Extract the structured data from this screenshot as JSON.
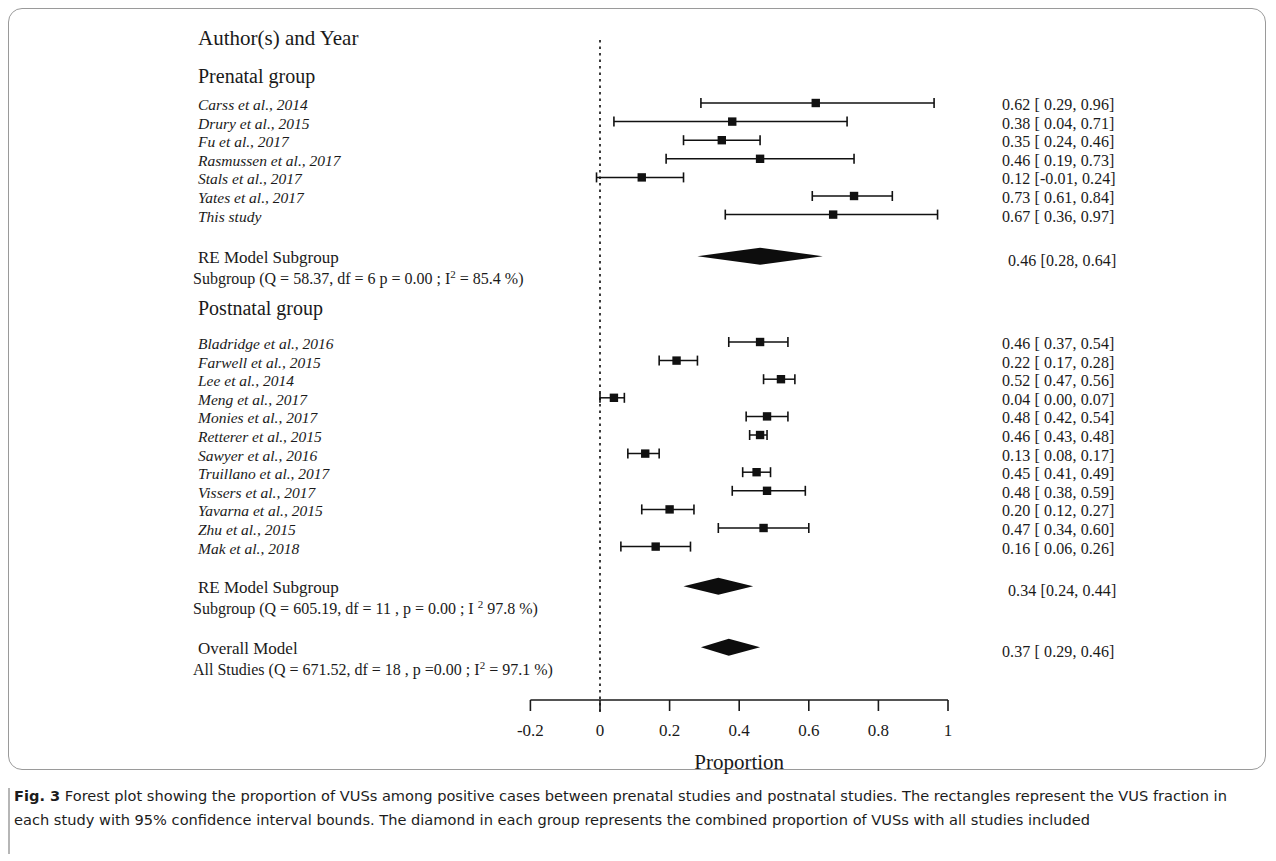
{
  "header": {
    "column_title": "Author(s) and Year"
  },
  "axis": {
    "title": "Proportion",
    "ticks": [
      "-0.2",
      "0",
      "0.2",
      "0.4",
      "0.6",
      "0.8",
      "1"
    ],
    "tick_values": [
      -0.2,
      0,
      0.2,
      0.4,
      0.6,
      0.8,
      1.0
    ],
    "min": -0.2,
    "max": 1.0,
    "reference_line": 0
  },
  "groups": [
    {
      "name": "Prenatal group",
      "summary_title": "RE Model Subgroup",
      "summary_stats_parts": {
        "pre": "Subgroup (Q = 58.37, df = 6 p = 0.00 ; I",
        "sup": "2",
        "post": " =  85.4 %)"
      },
      "summary_stats": "Subgroup (Q = 58.37, df = 6 p = 0.00 ; I2 =  85.4 %)",
      "summary_value_text": "0.46 [0.28, 0.64]",
      "summary_estimate": 0.46,
      "summary_ci": [
        0.28,
        0.64
      ],
      "studies": [
        {
          "label": "Carss et al., 2014",
          "value_text": "0.62 [ 0.29, 0.96]",
          "estimate": 0.62,
          "ci": [
            0.29,
            0.96
          ]
        },
        {
          "label": "Drury et al., 2015",
          "value_text": "0.38 [ 0.04, 0.71]",
          "estimate": 0.38,
          "ci": [
            0.04,
            0.71
          ]
        },
        {
          "label": "Fu et al., 2017",
          "value_text": "0.35 [ 0.24, 0.46]",
          "estimate": 0.35,
          "ci": [
            0.24,
            0.46
          ]
        },
        {
          "label": "Rasmussen et al., 2017",
          "value_text": "0.46 [ 0.19, 0.73]",
          "estimate": 0.46,
          "ci": [
            0.19,
            0.73
          ]
        },
        {
          "label": "Stals et al., 2017",
          "value_text": "0.12 [-0.01, 0.24]",
          "estimate": 0.12,
          "ci": [
            -0.01,
            0.24
          ]
        },
        {
          "label": "Yates et al., 2017",
          "value_text": "0.73 [ 0.61, 0.84]",
          "estimate": 0.73,
          "ci": [
            0.61,
            0.84
          ]
        },
        {
          "label": "This study",
          "value_text": "0.67 [ 0.36, 0.97]",
          "estimate": 0.67,
          "ci": [
            0.36,
            0.97
          ]
        }
      ]
    },
    {
      "name": "Postnatal group",
      "summary_title": "RE Model Subgroup",
      "summary_stats_parts": {
        "pre": "Subgroup (Q = 605.19, df = 11 , p = 0.00 ; I ",
        "sup": "2",
        "post": " 97.8 %)"
      },
      "summary_stats": "Subgroup (Q = 605.19, df = 11 , p = 0.00 ; I 2 97.8 %)",
      "summary_value_text": "0.34 [0.24, 0.44]",
      "summary_estimate": 0.34,
      "summary_ci": [
        0.24,
        0.44
      ],
      "studies": [
        {
          "label": "Bladridge et al., 2016",
          "value_text": "0.46 [ 0.37, 0.54]",
          "estimate": 0.46,
          "ci": [
            0.37,
            0.54
          ]
        },
        {
          "label": "Farwell et al., 2015",
          "value_text": "0.22 [ 0.17, 0.28]",
          "estimate": 0.22,
          "ci": [
            0.17,
            0.28
          ]
        },
        {
          "label": "Lee et al., 2014",
          "value_text": "0.52 [ 0.47, 0.56]",
          "estimate": 0.52,
          "ci": [
            0.47,
            0.56
          ]
        },
        {
          "label": "Meng et al., 2017",
          "value_text": "0.04 [ 0.00, 0.07]",
          "estimate": 0.04,
          "ci": [
            0.0,
            0.07
          ]
        },
        {
          "label": "Monies et al., 2017",
          "value_text": "0.48 [ 0.42, 0.54]",
          "estimate": 0.48,
          "ci": [
            0.42,
            0.54
          ]
        },
        {
          "label": "Retterer et al., 2015",
          "value_text": "0.46 [ 0.43, 0.48]",
          "estimate": 0.46,
          "ci": [
            0.43,
            0.48
          ]
        },
        {
          "label": "Sawyer et al., 2016",
          "value_text": "0.13 [ 0.08, 0.17]",
          "estimate": 0.13,
          "ci": [
            0.08,
            0.17
          ]
        },
        {
          "label": "Truillano et al., 2017",
          "value_text": "0.45 [ 0.41, 0.49]",
          "estimate": 0.45,
          "ci": [
            0.41,
            0.49
          ]
        },
        {
          "label": "Vissers et al., 2017",
          "value_text": "0.48 [ 0.38, 0.59]",
          "estimate": 0.48,
          "ci": [
            0.38,
            0.59
          ]
        },
        {
          "label": "Yavarna et al., 2015",
          "value_text": "0.20 [ 0.12, 0.27]",
          "estimate": 0.2,
          "ci": [
            0.12,
            0.27
          ]
        },
        {
          "label": "Zhu et al., 2015",
          "value_text": "0.47 [ 0.34, 0.60]",
          "estimate": 0.47,
          "ci": [
            0.34,
            0.6
          ]
        },
        {
          "label": "Mak et al., 2018",
          "value_text": "0.16 [ 0.06, 0.26]",
          "estimate": 0.16,
          "ci": [
            0.06,
            0.26
          ]
        }
      ]
    }
  ],
  "overall": {
    "summary_title": "Overall Model",
    "summary_stats_parts": {
      "pre": "All Studies (Q = 671.52, df = 18 , p =0.00 ; I",
      "sup": "2",
      "post": " =  97.1 %)"
    },
    "summary_stats": "All Studies (Q = 671.52, df = 18 , p =0.00 ; I2 =  97.1 %)",
    "summary_value_text": "0.37 [ 0.29, 0.46]",
    "summary_estimate": 0.37,
    "summary_ci": [
      0.29,
      0.46
    ]
  },
  "caption": {
    "figure_label": "Fig. 3",
    "text": " Forest plot showing the proportion of VUSs among positive cases between prenatal studies and postnatal studies. The rectangles represent the VUS fraction in each study with 95% confidence interval bounds. The diamond in each group represents the combined proportion of VUSs with all studies included"
  },
  "chart_data": {
    "type": "forest",
    "xlabel": "Proportion",
    "ylabel": "",
    "xlim": [
      -0.2,
      1.0
    ],
    "xticks": [
      -0.2,
      0,
      0.2,
      0.4,
      0.6,
      0.8,
      1.0
    ],
    "reference_line": 0,
    "grid": false,
    "legend": "none",
    "marker": "square",
    "summary_marker": "diamond",
    "categories": [
      "Carss et al., 2014",
      "Drury et al., 2015",
      "Fu et al., 2017",
      "Rasmussen et al., 2017",
      "Stals et al., 2017",
      "Yates et al., 2017",
      "This study",
      "RE Model Subgroup (Prenatal)",
      "Bladridge et al., 2016",
      "Farwell et al., 2015",
      "Lee et al., 2014",
      "Meng et al., 2017",
      "Monies et al., 2017",
      "Retterer et al., 2015",
      "Sawyer et al., 2016",
      "Truillano et al., 2017",
      "Vissers et al., 2017",
      "Yavarna et al., 2015",
      "Zhu et al., 2015",
      "Mak et al., 2018",
      "RE Model Subgroup (Postnatal)",
      "Overall Model"
    ],
    "values": [
      0.62,
      0.38,
      0.35,
      0.46,
      0.12,
      0.73,
      0.67,
      0.46,
      0.46,
      0.22,
      0.52,
      0.04,
      0.48,
      0.46,
      0.13,
      0.45,
      0.48,
      0.2,
      0.47,
      0.16,
      0.34,
      0.37
    ],
    "ci_lower": [
      0.29,
      0.04,
      0.24,
      0.19,
      -0.01,
      0.61,
      0.36,
      0.28,
      0.37,
      0.17,
      0.47,
      0.0,
      0.42,
      0.43,
      0.08,
      0.41,
      0.38,
      0.12,
      0.34,
      0.06,
      0.24,
      0.29
    ],
    "ci_upper": [
      0.96,
      0.71,
      0.46,
      0.73,
      0.24,
      0.84,
      0.97,
      0.64,
      0.54,
      0.28,
      0.56,
      0.07,
      0.54,
      0.48,
      0.17,
      0.49,
      0.59,
      0.27,
      0.6,
      0.26,
      0.44,
      0.46
    ],
    "heterogeneity": {
      "prenatal": {
        "Q": 58.37,
        "df": 6,
        "p": 0.0,
        "I2_percent": 85.4
      },
      "postnatal": {
        "Q": 605.19,
        "df": 11,
        "p": 0.0,
        "I2_percent": 97.8
      },
      "overall": {
        "Q": 671.52,
        "df": 18,
        "p": 0.0,
        "I2_percent": 97.1
      }
    }
  }
}
